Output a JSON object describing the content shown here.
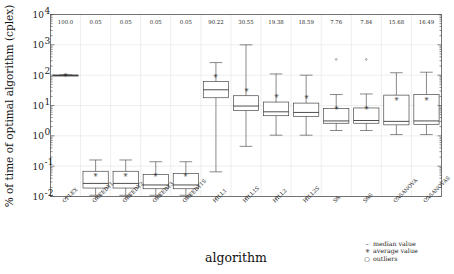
{
  "figure": {
    "ylabel": "% of time of optimal algorithm (cplex)",
    "xlabel": "algorithm",
    "ytick_labels": [
      "10^-2",
      "10^-1",
      "10^0",
      "10^1",
      "10^2",
      "10^3",
      "10^4"
    ],
    "ytick_exponents": [
      "-2",
      "-1",
      "0",
      "1",
      "2",
      "3",
      "4"
    ],
    "ytick_mantissa": "10"
  },
  "legend": {
    "position": "bottom-right",
    "entries": [
      {
        "symbol": "-",
        "label": "median value"
      },
      {
        "symbol": "*",
        "label": "average value"
      },
      {
        "symbol": "o",
        "label": "outliers"
      }
    ]
  },
  "colors": {
    "box_stroke": "#3a3a3a",
    "box_fill": "#ffffff",
    "grid": "#d9d9d9",
    "frame": "#555555",
    "text": "#1a1a1a"
  },
  "chart_data": {
    "type": "box",
    "title": "",
    "subtitle": "",
    "xlabel": "algorithm",
    "ylabel": "% of time of optimal algorithm (cplex)",
    "yscale": "log",
    "ylim": [
      0.01,
      10000
    ],
    "grid": true,
    "legend_position": "bottom-right",
    "top_annotation_note": "value printed above each box",
    "categories": [
      "CPLEX",
      "GREEDY1",
      "GREEDY2",
      "GREEDY3",
      "GREEDY1S",
      "HILL1",
      "HILL1S",
      "HILL2",
      "HILL2S",
      "SA",
      "SAS",
      "CASANOVA",
      "CASANOVAS"
    ],
    "top_values": [
      100.0,
      0.05,
      0.05,
      0.05,
      0.05,
      90.22,
      30.55,
      19.38,
      18.59,
      7.76,
      7.84,
      15.68,
      16.49
    ],
    "boxes": [
      {
        "category": "CPLEX",
        "whisker_low": 100.0,
        "q1": 100.0,
        "median": 100.0,
        "q3": 100.0,
        "whisker_high": 100.0,
        "average": 100.0,
        "outliers": []
      },
      {
        "category": "GREEDY1",
        "whisker_low": 0.011,
        "q1": 0.019,
        "median": 0.027,
        "q3": 0.068,
        "whisker_high": 0.16,
        "average": 0.05,
        "outliers": []
      },
      {
        "category": "GREEDY2",
        "whisker_low": 0.011,
        "q1": 0.019,
        "median": 0.027,
        "q3": 0.068,
        "whisker_high": 0.16,
        "average": 0.05,
        "outliers": []
      },
      {
        "category": "GREEDY3",
        "whisker_low": 0.011,
        "q1": 0.018,
        "median": 0.024,
        "q3": 0.053,
        "whisker_high": 0.14,
        "average": 0.05,
        "outliers": []
      },
      {
        "category": "GREEDY1S",
        "whisker_low": 0.011,
        "q1": 0.018,
        "median": 0.024,
        "q3": 0.057,
        "whisker_high": 0.14,
        "average": 0.05,
        "outliers": []
      },
      {
        "category": "HILL1",
        "whisker_low": 0.065,
        "q1": 18.0,
        "median": 33.0,
        "q3": 62.0,
        "whisker_high": 260.0,
        "average": 90.22,
        "outliers": []
      },
      {
        "category": "HILL1S",
        "whisker_low": 0.45,
        "q1": 6.8,
        "median": 9.6,
        "q3": 21.0,
        "whisker_high": 1000.0,
        "average": 30.55,
        "outliers": []
      },
      {
        "category": "HILL2",
        "whisker_low": 1.05,
        "q1": 4.6,
        "median": 6.2,
        "q3": 13.0,
        "whisker_high": 110.0,
        "average": 19.38,
        "outliers": []
      },
      {
        "category": "HILL2S",
        "whisker_low": 1.05,
        "q1": 4.4,
        "median": 5.9,
        "q3": 12.0,
        "whisker_high": 100.0,
        "average": 18.59,
        "outliers": []
      },
      {
        "category": "SA",
        "whisker_low": 1.5,
        "q1": 2.6,
        "median": 3.1,
        "q3": 8.0,
        "whisker_high": 23.0,
        "average": 7.76,
        "outliers": [
          330.0
        ]
      },
      {
        "category": "SAS",
        "whisker_low": 1.5,
        "q1": 2.6,
        "median": 3.2,
        "q3": 8.3,
        "whisker_high": 24.0,
        "average": 7.84,
        "outliers": [
          330.0
        ]
      },
      {
        "category": "CASANOVA",
        "whisker_low": 1.1,
        "q1": 2.3,
        "median": 3.0,
        "q3": 22.0,
        "whisker_high": 120.0,
        "average": 15.68,
        "outliers": []
      },
      {
        "category": "CASANOVAS",
        "whisker_low": 1.1,
        "q1": 2.4,
        "median": 3.1,
        "q3": 23.0,
        "whisker_high": 125.0,
        "average": 16.49,
        "outliers": []
      }
    ]
  }
}
